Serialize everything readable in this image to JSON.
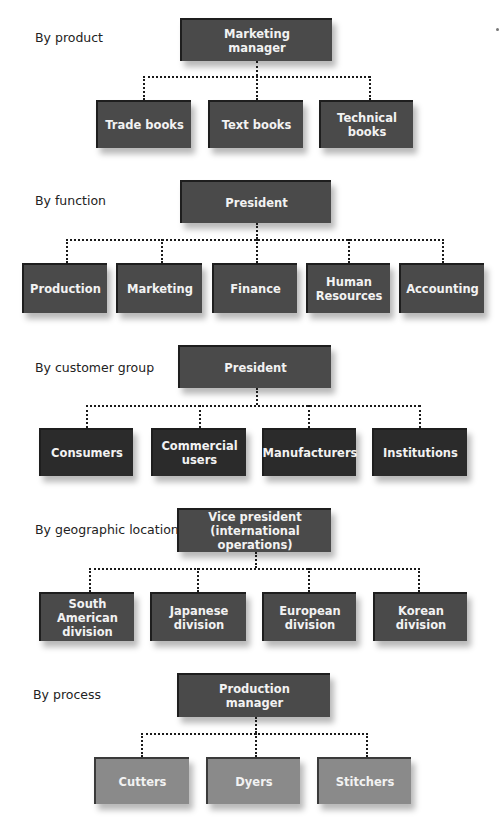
{
  "diagram": {
    "type": "organization-charts",
    "sections": [
      {
        "label": "By product",
        "root": "Marketing\nmanager",
        "children": [
          "Trade books",
          "Text books",
          "Technical\nbooks"
        ]
      },
      {
        "label": "By function",
        "root": "President",
        "children": [
          "Production",
          "Marketing",
          "Finance",
          "Human\nResources",
          "Accounting"
        ]
      },
      {
        "label": "By customer group",
        "root": "President",
        "children": [
          "Consumers",
          "Commercial\nusers",
          "Manufacturers",
          "Institutions"
        ]
      },
      {
        "label": "By geographic location",
        "root": "Vice president\n(international operations)",
        "children": [
          "South American\ndivision",
          "Japanese\ndivision",
          "European\ndivision",
          "Korean\ndivision"
        ]
      },
      {
        "label": "By process",
        "root": "Production\nmanager",
        "children": [
          "Cutters",
          "Dyers",
          "Stitchers"
        ]
      }
    ],
    "colors": {
      "box_default": "#4a4a4a",
      "box_customer_children": "#2b2b2b",
      "box_process_children": "#8a8a8a",
      "box_text": "#f2f2f2",
      "connector": "#1a1a1a"
    }
  }
}
